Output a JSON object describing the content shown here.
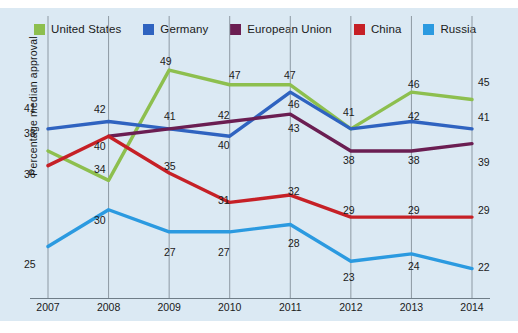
{
  "chart_data": {
    "type": "line",
    "title": "",
    "xlabel": "",
    "ylabel": "Percentage median approval",
    "categories": [
      "2007",
      "2008",
      "2009",
      "2010",
      "2011",
      "2012",
      "2013",
      "2014"
    ],
    "x": [
      2007,
      2008,
      2009,
      2010,
      2011,
      2012,
      2013,
      2014
    ],
    "ylim": [
      18,
      52
    ],
    "grid": "vertical",
    "legend_position": "top",
    "series": [
      {
        "name": "United States",
        "color": "#8dbf4e",
        "values": [
          38,
          34,
          49,
          47,
          47,
          41,
          46,
          45
        ],
        "labels": [
          "38",
          "34",
          "49",
          "47",
          "47",
          "41",
          "46",
          "45"
        ]
      },
      {
        "name": "Germany",
        "color": "#2f63c0",
        "values": [
          41,
          42,
          41,
          40,
          46,
          41,
          42,
          41
        ],
        "labels": [
          "41",
          "42",
          "41",
          "40",
          "46",
          "41",
          "42",
          "41"
        ]
      },
      {
        "name": "European Union",
        "color": "#6b1e52",
        "values": [
          null,
          40,
          41,
          42,
          43,
          38,
          38,
          39
        ],
        "labels": [
          "",
          "40",
          "41",
          "42",
          "43",
          "38",
          "38",
          "39"
        ]
      },
      {
        "name": "China",
        "color": "#c62026",
        "values": [
          36,
          40,
          35,
          31,
          32,
          29,
          29,
          29
        ],
        "labels": [
          "36",
          "40",
          "35",
          "31",
          "32",
          "29",
          "29",
          "29"
        ]
      },
      {
        "name": "Russia",
        "color": "#2b9ae0",
        "values": [
          25,
          30,
          27,
          27,
          28,
          23,
          24,
          22
        ],
        "labels": [
          "25",
          "30",
          "27",
          "27",
          "28",
          "23",
          "24",
          "22"
        ]
      }
    ],
    "point_labels": [
      {
        "series": "Germany",
        "year": "2007",
        "text": "41",
        "x": 24,
        "y": 103
      },
      {
        "series": "United States",
        "year": "2007",
        "text": "38",
        "x": 24,
        "y": 128
      },
      {
        "series": "China",
        "year": "2007",
        "text": "36",
        "x": 24,
        "y": 169
      },
      {
        "series": "Russia",
        "year": "2007",
        "text": "25",
        "x": 24,
        "y": 259
      },
      {
        "series": "Germany",
        "year": "2008",
        "text": "42",
        "x": 94,
        "y": 104
      },
      {
        "series": "China",
        "year": "2008",
        "text": "40",
        "x": 94,
        "y": 141
      },
      {
        "series": "United States",
        "year": "2008",
        "text": "34",
        "x": 94,
        "y": 164
      },
      {
        "series": "Russia",
        "year": "2008",
        "text": "30",
        "x": 94,
        "y": 215
      },
      {
        "series": "United States",
        "year": "2009",
        "text": "49",
        "x": 160,
        "y": 56
      },
      {
        "series": "Germany",
        "year": "2009",
        "text": "41",
        "x": 164,
        "y": 111
      },
      {
        "series": "China",
        "year": "2009",
        "text": "35",
        "x": 164,
        "y": 161
      },
      {
        "series": "Russia",
        "year": "2009",
        "text": "27",
        "x": 164,
        "y": 247
      },
      {
        "series": "United States",
        "year": "2010",
        "text": "47",
        "x": 229,
        "y": 70
      },
      {
        "series": "European Union",
        "year": "2010",
        "text": "42",
        "x": 218,
        "y": 110
      },
      {
        "series": "Germany",
        "year": "2010",
        "text": "40",
        "x": 218,
        "y": 140
      },
      {
        "series": "China",
        "year": "2010",
        "text": "31",
        "x": 218,
        "y": 195
      },
      {
        "series": "Russia",
        "year": "2010",
        "text": "27",
        "x": 218,
        "y": 247
      },
      {
        "series": "United States",
        "year": "2011",
        "text": "47",
        "x": 284,
        "y": 70
      },
      {
        "series": "Germany",
        "year": "2011",
        "text": "46",
        "x": 288,
        "y": 99
      },
      {
        "series": "European Union",
        "year": "2011",
        "text": "43",
        "x": 288,
        "y": 123
      },
      {
        "series": "China",
        "year": "2011",
        "text": "32",
        "x": 288,
        "y": 186
      },
      {
        "series": "Russia",
        "year": "2011",
        "text": "28",
        "x": 288,
        "y": 238
      },
      {
        "series": "United States",
        "year": "2012",
        "text": "41",
        "x": 343,
        "y": 107
      },
      {
        "series": "European Union",
        "year": "2012",
        "text": "38",
        "x": 343,
        "y": 155
      },
      {
        "series": "China",
        "year": "2012",
        "text": "29",
        "x": 343,
        "y": 205
      },
      {
        "series": "Russia",
        "year": "2012",
        "text": "23",
        "x": 343,
        "y": 272
      },
      {
        "series": "United States",
        "year": "2013",
        "text": "46",
        "x": 408,
        "y": 79
      },
      {
        "series": "Germany",
        "year": "2013",
        "text": "42",
        "x": 408,
        "y": 111
      },
      {
        "series": "European Union",
        "year": "2013",
        "text": "38",
        "x": 408,
        "y": 155
      },
      {
        "series": "China",
        "year": "2013",
        "text": "29",
        "x": 408,
        "y": 205
      },
      {
        "series": "Russia",
        "year": "2013",
        "text": "24",
        "x": 408,
        "y": 261
      },
      {
        "series": "United States",
        "year": "2014",
        "text": "45",
        "x": 478,
        "y": 77
      },
      {
        "series": "Germany",
        "year": "2014",
        "text": "41",
        "x": 478,
        "y": 112
      },
      {
        "series": "European Union",
        "year": "2014",
        "text": "39",
        "x": 478,
        "y": 157
      },
      {
        "series": "China",
        "year": "2014",
        "text": "29",
        "x": 478,
        "y": 205
      },
      {
        "series": "Russia",
        "year": "2014",
        "text": "22",
        "x": 478,
        "y": 262
      }
    ]
  },
  "legend": {
    "items": [
      {
        "label": "United States",
        "color": "#8dbf4e",
        "swatch": "legend-swatch-united-states"
      },
      {
        "label": "Germany",
        "color": "#2f63c0",
        "swatch": "legend-swatch-germany"
      },
      {
        "label": "European Union",
        "color": "#6b1e52",
        "swatch": "legend-swatch-european-union"
      },
      {
        "label": "China",
        "color": "#c62026",
        "swatch": "legend-swatch-china"
      },
      {
        "label": "Russia",
        "color": "#2b9ae0",
        "swatch": "legend-swatch-russia"
      }
    ]
  },
  "colors": {
    "panel_background": "#dbe9f3",
    "page_background": "#ffffff",
    "axis": "#6f7d87",
    "gridline": "#8d99a3",
    "text": "#1a1a1a"
  }
}
